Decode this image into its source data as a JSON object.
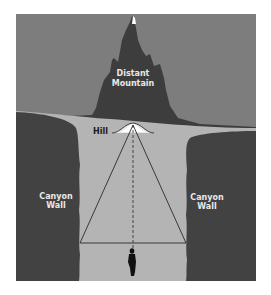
{
  "diagram": {
    "labels": {
      "mountain_line1": "Distant",
      "mountain_line2": "Mountain",
      "hill": "Hill",
      "left_wall_line1": "Canyon",
      "left_wall_line2": "Wall",
      "right_wall_line1": "Canyon",
      "right_wall_line2": "Wall"
    },
    "colors": {
      "sky": "#7d7d7d",
      "mountain": "#3d3d3d",
      "ground": "#b4b4b4",
      "canyon_wall": "#424242",
      "label_light": "#e8e8e8",
      "label_dark": "#1a1a1a",
      "line": "#2a2a2a",
      "peak": "#ffffff",
      "figure": "#111111"
    }
  }
}
